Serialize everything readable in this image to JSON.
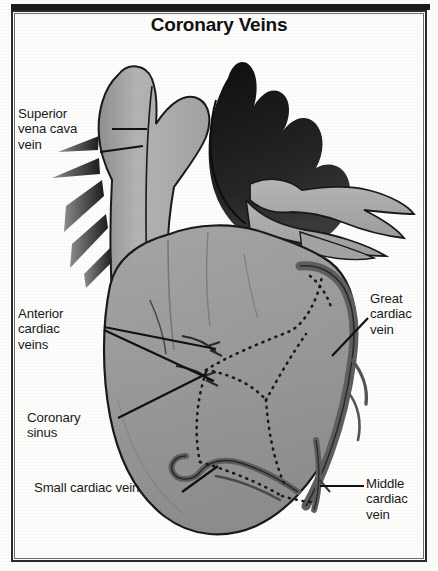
{
  "figure": {
    "title": "Coronary Veins",
    "background_color": "#fdfdfc",
    "frame_color": "#2b2b2b"
  },
  "palette": {
    "myocardium_gray": "#9a9a9a",
    "myocardium_gray_dark": "#8a8a8a",
    "vessel_light_gray": "#b0b0b0",
    "great_vessel_black": "#1c1c1c",
    "vein_dark_gray": "#6b6b6b",
    "outline_black": "#1a1a1a",
    "label_text": "#1a1a1a",
    "paper_white": "#fdfdfc"
  },
  "labels": [
    {
      "id": "superior-vena-cava-vein",
      "text": "Superior\nvena cava\nvein",
      "position": "left",
      "leader_lines": 2
    },
    {
      "id": "anterior-cardiac-veins",
      "text": "Anterior\ncardiac\nveins",
      "position": "left",
      "leader_lines": 2
    },
    {
      "id": "coronary-sinus",
      "text": "Coronary\nsinus",
      "position": "left",
      "leader_lines": 1
    },
    {
      "id": "small-cardiac-vein",
      "text": "Small cardiac vein",
      "position": "left-bottom",
      "leader_lines": 1
    },
    {
      "id": "great-cardiac-vein",
      "text": "Great\ncardiac\nvein",
      "position": "right",
      "leader_lines": 1
    },
    {
      "id": "middle-cardiac-vein",
      "text": "Middle\ncardiac\nvein",
      "position": "right-bottom",
      "leader_lines": 1
    }
  ],
  "structures": [
    {
      "id": "aortic-arch",
      "shade": "black"
    },
    {
      "id": "superior-vena-cava",
      "shade": "light-gray"
    },
    {
      "id": "pulmonary-trunk",
      "shade": "light-gray"
    },
    {
      "id": "pulmonary-veins",
      "shade": "light-gray"
    },
    {
      "id": "right-atrium",
      "shade": "gray"
    },
    {
      "id": "right-ventricle",
      "shade": "gray"
    },
    {
      "id": "left-ventricle",
      "shade": "gray"
    },
    {
      "id": "great-cardiac-vein-vessel",
      "shade": "dark-gray"
    },
    {
      "id": "middle-cardiac-vein-vessel",
      "shade": "dark-gray"
    },
    {
      "id": "small-cardiac-vein-vessel",
      "shade": "dark-gray"
    },
    {
      "id": "coronary-sinus-vessel",
      "shade": "dark-gray"
    },
    {
      "id": "anterior-cardiac-veins-vessel",
      "shade": "dark-gray"
    },
    {
      "id": "hidden-vessels-dotted",
      "shade": "dotted-black"
    }
  ]
}
